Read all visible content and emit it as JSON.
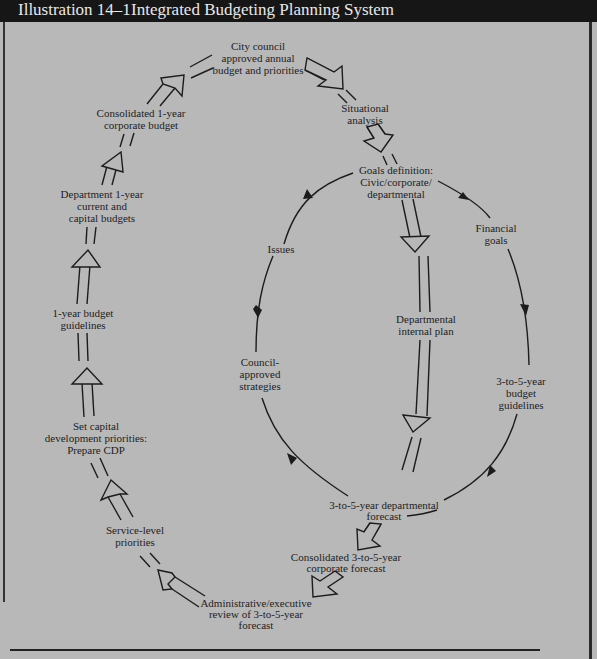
{
  "header": {
    "illustration_number": "Illustration 14–1",
    "title": "Integrated Budgeting Planning System"
  },
  "nodes": {
    "city_council": [
      "City council",
      "approved annual",
      "budget and priorities"
    ],
    "situational": [
      "Situational",
      "analysis"
    ],
    "goals": [
      "Goals definition:",
      "Civic/corporate/",
      "departmental"
    ],
    "issues": [
      "Issues"
    ],
    "financial_goals": [
      "Financial",
      "goals"
    ],
    "dept_internal": [
      "Departmental",
      "internal plan"
    ],
    "council_strategies": [
      "Council-",
      "approved",
      "strategies"
    ],
    "budget_guidelines_3to5": [
      "3-to-5-year",
      "budget",
      "guidelines"
    ],
    "dept_forecast": [
      "3-to-5-year departmental",
      "forecast"
    ],
    "corp_forecast": [
      "Consolidated 3-to-5-year",
      "corporate forecast"
    ],
    "admin_review": [
      "Administrative/executive",
      "review of 3-to-5-year",
      "forecast"
    ],
    "service_level": [
      "Service-level",
      "priorities"
    ],
    "capital_dev": [
      "Set capital",
      "development priorities:",
      "Prepare CDP"
    ],
    "budget_guidelines_1yr": [
      "1-year budget",
      "guidelines"
    ],
    "dept_1yr": [
      "Department 1-year",
      "current and",
      "capital budgets"
    ],
    "consolidated_1yr": [
      "Consolidated 1-year",
      "corporate budget"
    ]
  },
  "colors": {
    "background": "#b8b8b8",
    "title_bar": "#161616",
    "title_text": "#e8e8e8",
    "ink": "#1c1c1c"
  }
}
